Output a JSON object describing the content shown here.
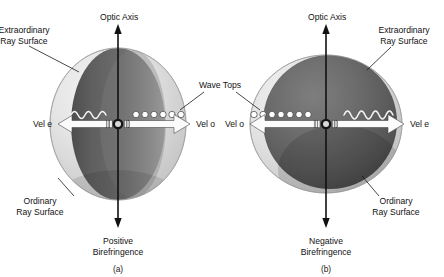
{
  "figure": {
    "background_color": "#ffffff",
    "text_color": "#121212",
    "shared_labels": {
      "wave_tops": "Wave Tops",
      "optic_axis": "Optic Axis",
      "extraordinary_ray_surface": "Extraordinary\nRay Surface",
      "extraordinary_ray_surface_line1": "Extraordinary",
      "extraordinary_ray_surface_line2": "Ray Surface",
      "ordinary_ray_surface_line1": "Ordinary",
      "ordinary_ray_surface_line2": "Ray Surface"
    },
    "panels": [
      {
        "id": "a",
        "caption": "(a)",
        "optic_axis_label": "Optic Axis",
        "birefringence_line1": "Positive",
        "birefringence_line2": "Birefringence",
        "birefringence_type": "Positive Birefringence",
        "extraordinary_label_line1": "Extraordinary",
        "extraordinary_label_line2": "Ray Surface",
        "extraordinary_label_position": "top-left",
        "ordinary_label_line1": "Ordinary",
        "ordinary_label_line2": "Ray Surface",
        "ordinary_label_position": "bottom-left",
        "left_velocity_label": "Vel e",
        "right_velocity_label": "Vel o",
        "left_wave_representation": "sine-wave",
        "right_wave_representation": "wave-top-circles",
        "right_wave_top_count": 6,
        "surface_shape": "prolate",
        "outer_surface": "extraordinary",
        "inner_surface": "ordinary",
        "outer_surface_color": "#dcdcdc",
        "inner_surface_color": "#6e6e6e"
      },
      {
        "id": "b",
        "caption": "(b)",
        "optic_axis_label": "Optic Axis",
        "birefringence_line1": "Negative",
        "birefringence_line2": "Birefringence",
        "birefringence_type": "Negative Birefringence",
        "extraordinary_label_line1": "Extraordinary",
        "extraordinary_label_line2": "Ray Surface",
        "extraordinary_label_position": "top-right",
        "ordinary_label_line1": "Ordinary",
        "ordinary_label_line2": "Ray Surface",
        "ordinary_label_position": "bottom-right",
        "left_velocity_label": "Vel o",
        "right_velocity_label": "Vel e",
        "left_wave_representation": "wave-top-circles",
        "left_wave_top_count": 7,
        "right_wave_representation": "sine-wave",
        "surface_shape": "oblate",
        "outer_surface": "ordinary",
        "inner_surface": "extraordinary",
        "outer_surface_color": "#6e6e6e",
        "inner_surface_color": "#dcdcdc"
      }
    ],
    "colors": {
      "light_surface": "#dcdcdc",
      "dark_surface": "#6e6e6e",
      "darkest_shade": "#4a4a4a",
      "arrow_fill": "#fbfbfb",
      "axis": "#111111",
      "wave_stroke": "#f2f2f2"
    }
  }
}
